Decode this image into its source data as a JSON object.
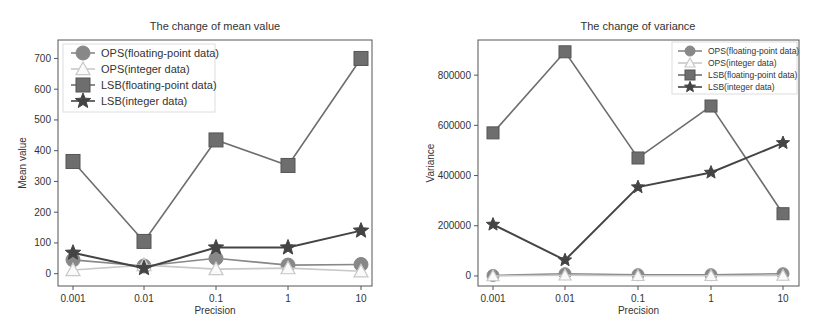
{
  "chart_data": [
    {
      "type": "line",
      "title": "The change of mean value",
      "xlabel": "Precision",
      "ylabel": "Mean value",
      "categories": [
        "0.001",
        "0.01",
        "0.1",
        "1",
        "10"
      ],
      "yticks": [
        0,
        100,
        200,
        300,
        400,
        500,
        600,
        700
      ],
      "ylim": [
        -40,
        760
      ],
      "grid": false,
      "legend_position": "upper left",
      "series": [
        {
          "name": "OPS(floating-point data)",
          "marker": "circle",
          "color": "#888888",
          "values": [
            45,
            25,
            50,
            28,
            30
          ]
        },
        {
          "name": "OPS(integer data)",
          "marker": "triangle",
          "color": "#c8c8c8",
          "values": [
            12,
            28,
            15,
            18,
            8
          ]
        },
        {
          "name": "LSB(floating-point data)",
          "marker": "square",
          "color": "#6e6e6e",
          "values": [
            365,
            105,
            435,
            352,
            700
          ]
        },
        {
          "name": "LSB(integer data)",
          "marker": "star",
          "color": "#444444",
          "values": [
            68,
            18,
            85,
            85,
            140
          ]
        }
      ]
    },
    {
      "type": "line",
      "title": "The change of variance",
      "xlabel": "Precision",
      "ylabel": "Variance",
      "categories": [
        "0.001",
        "0.01",
        "0.1",
        "1",
        "10"
      ],
      "yticks": [
        0,
        200000,
        400000,
        600000,
        800000
      ],
      "ylim": [
        -40000,
        940000
      ],
      "grid": false,
      "legend_position": "upper right",
      "series": [
        {
          "name": "OPS(floating-point data)",
          "marker": "circle",
          "color": "#888888",
          "values": [
            2000,
            9000,
            5000,
            5000,
            9000
          ]
        },
        {
          "name": "OPS(integer data)",
          "marker": "triangle",
          "color": "#c8c8c8",
          "values": [
            0,
            3000,
            1000,
            1000,
            2000
          ]
        },
        {
          "name": "LSB(floating-point data)",
          "marker": "square",
          "color": "#6e6e6e",
          "values": [
            570000,
            893000,
            470000,
            677000,
            248000
          ]
        },
        {
          "name": "LSB(integer data)",
          "marker": "star",
          "color": "#444444",
          "values": [
            205000,
            63000,
            354000,
            412000,
            530000
          ]
        }
      ]
    }
  ]
}
